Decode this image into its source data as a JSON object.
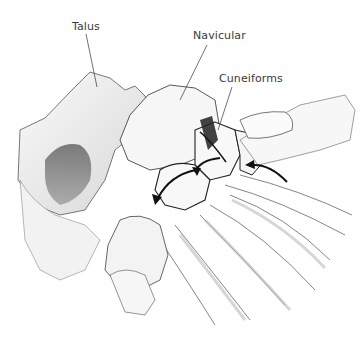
{
  "figure": {
    "labels": [
      {
        "id": "talus",
        "text": "Talus"
      },
      {
        "id": "navicular",
        "text": "Navicular"
      },
      {
        "id": "cuneiforms",
        "text": "Cuneiforms"
      }
    ],
    "arrows": [
      {
        "name": "curved-arrow-left",
        "direction": "down-left"
      },
      {
        "name": "curved-arrow-center",
        "direction": "up-left"
      },
      {
        "name": "curved-arrow-right",
        "direction": "left"
      }
    ],
    "colors": {
      "ink": "#1a1a1a",
      "bone_fill": "#f4f4f4",
      "shade": "#9a9a9a",
      "label_text": "#3a3a3a",
      "background": "#ffffff"
    }
  }
}
